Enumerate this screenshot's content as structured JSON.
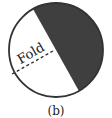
{
  "figure": {
    "caption": "(b)",
    "fold_label": "Fold",
    "colors": {
      "shaded": "#3f3f3f",
      "outline": "#333333",
      "background": "#ffffff"
    }
  }
}
